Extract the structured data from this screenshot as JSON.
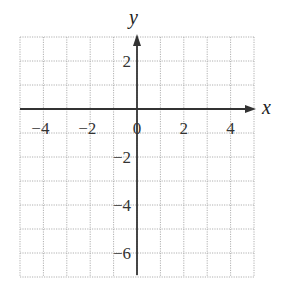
{
  "chart_data": {
    "type": "scatter",
    "title": "",
    "xlabel": "x",
    "ylabel": "y",
    "xlim": [
      -5,
      5
    ],
    "ylim": [
      -7,
      3
    ],
    "grid": true,
    "grid_style": "dotted",
    "x_ticks": [
      -4,
      -2,
      0,
      2,
      4
    ],
    "y_ticks": [
      2,
      -2,
      -4,
      -6
    ],
    "x_tick_labels": [
      "−4",
      "−2",
      "0",
      "2",
      "4"
    ],
    "y_tick_labels": [
      "2",
      "−2",
      "−4",
      "−6"
    ],
    "series": [],
    "legend": null
  },
  "colors": {
    "axis": "#333333",
    "grid": "#b0b0b0",
    "text": "#333333"
  }
}
